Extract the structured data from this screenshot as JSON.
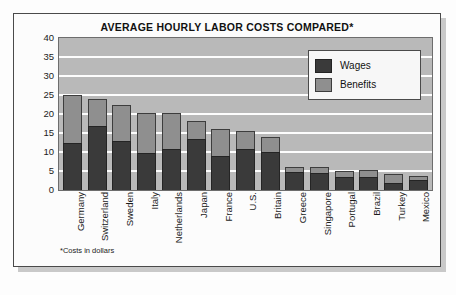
{
  "chart_data": {
    "type": "bar",
    "subtype": "stacked-vertical",
    "title": "AVERAGE HOURLY LABOR COSTS COMPARED*",
    "footnote": "*Costs in dollars",
    "xlabel": "",
    "ylabel": "",
    "ylim": [
      0,
      40
    ],
    "yticks": [
      40,
      35,
      30,
      25,
      20,
      15,
      10,
      5,
      0
    ],
    "grid": true,
    "legend_position": "top-right",
    "categories": [
      "Germany",
      "Switzerland",
      "Sweden",
      "Italy",
      "Netherlands",
      "Japan",
      "France",
      "U.S.",
      "Britain",
      "Greece",
      "Singapore",
      "Portugal",
      "Brazil",
      "Turkey",
      "Mexico"
    ],
    "series": [
      {
        "name": "Wages",
        "color": "#3a3a3a",
        "values": [
          12.5,
          16.9,
          13.0,
          9.7,
          10.8,
          13.5,
          9.0,
          10.8,
          10.0,
          4.8,
          4.4,
          3.3,
          3.3,
          1.8,
          2.6
        ]
      },
      {
        "name": "Benefits",
        "color": "#8f8f8f",
        "values": [
          12.5,
          7.1,
          9.5,
          10.5,
          9.4,
          4.7,
          7.0,
          4.8,
          4.0,
          1.2,
          1.6,
          1.7,
          1.9,
          2.4,
          1.0
        ]
      }
    ],
    "totals": [
      25.0,
      24.0,
      22.5,
      20.2,
      20.2,
      18.2,
      16.0,
      15.6,
      14.0,
      6.0,
      6.0,
      5.0,
      5.2,
      4.2,
      3.6
    ]
  },
  "legend": {
    "items": [
      {
        "label": "Wages",
        "swatch": "wages-swatch"
      },
      {
        "label": "Benefits",
        "swatch": "benefits-swatch"
      }
    ]
  },
  "colors": {
    "wages": "#3a3a3a",
    "benefits": "#8f8f8f",
    "plot_background": "#b9b9b9",
    "gridline": "#fdfdfd",
    "frame_border": "#4a4a4a"
  }
}
